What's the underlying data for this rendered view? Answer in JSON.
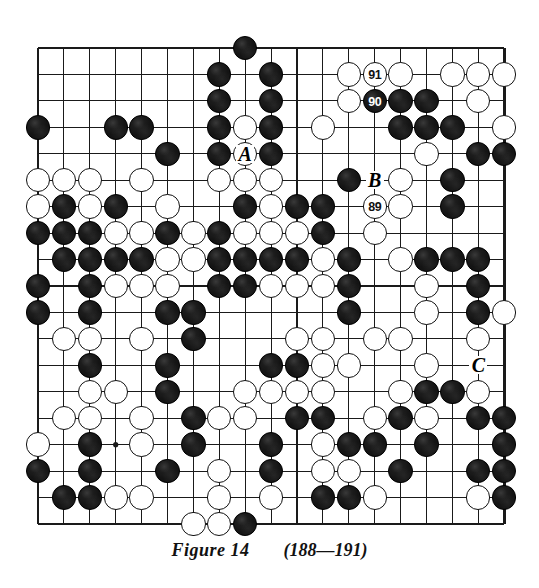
{
  "figure": {
    "caption_title": "Figure 14",
    "caption_moves": "(188—191)",
    "board_size": 19,
    "board_colors": {
      "background": "#ffffff",
      "line": "#1a1a1a",
      "black_stone": "#141414",
      "white_stone": "#ffffff",
      "stone_outline": "#111111"
    }
  },
  "board": {
    "description": "19x19 Go position. Grid rows top(1) to bottom(19), columns left(1) to right(19).",
    "star_points": [
      [
        4,
        4
      ],
      [
        4,
        10
      ],
      [
        4,
        16
      ],
      [
        10,
        4
      ],
      [
        10,
        10
      ],
      [
        10,
        16
      ],
      [
        16,
        4
      ],
      [
        16,
        10
      ],
      [
        16,
        16
      ]
    ],
    "rows": [
      "........B..........",
      ".......B.B..O.O.OOO",
      ".......B.B..OBBB.O.",
      "B..BB..BOB.O..BBB.O",
      ".....B.BOB.....O.BB",
      "OOO.O..OOO..B.O.B..",
      "OBOB O..BOBB.OO.B..",
      "BBBOOBOBOOOB.O.....",
      ".BBBBOOBBBBOB.OBBB.",
      "B.BOOO.BBOOOB..O.B.",
      "B.B..BB.....B..O.BO",
      ".OO.O.B...OO.OO..O.",
      "..B..B...BBOO..O.C.",
      "..OO.B..OOOO..OBBO.",
      ".OO.O.BOO.BB.OBO.BB",
      "O.B.O.B..B.OBB.B..B",
      "B.B..B.O.B.OO.B..BB",
      ".BBOO..O.O.BBO...OB",
      "......OOB.........."
    ],
    "note_rows_legend": "B = black stone, O = white stone, . = empty"
  },
  "numbered_stones": [
    {
      "label": "88",
      "color": "black",
      "text_color": "white",
      "row": 7,
      "col": 15
    },
    {
      "label": "89",
      "color": "white",
      "text_color": "black",
      "row": 7,
      "col": 14
    },
    {
      "label": "90",
      "color": "black",
      "text_color": "white",
      "row": 3,
      "col": 14
    },
    {
      "label": "91",
      "color": "white",
      "text_color": "black",
      "row": 2,
      "col": 14
    }
  ],
  "letter_markers": [
    {
      "label": "A",
      "row": 5,
      "col": 9
    },
    {
      "label": "B",
      "row": 6,
      "col": 14
    },
    {
      "label": "C",
      "row": 13,
      "col": 18
    }
  ]
}
